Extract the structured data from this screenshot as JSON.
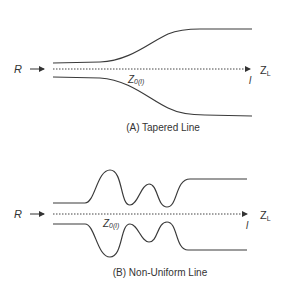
{
  "panels": [
    {
      "id": "A",
      "caption": "(A) Tapered Line",
      "source_label": "R",
      "impedance_label": "Z",
      "impedance_sub": "0(l)",
      "load_label": "Z",
      "load_sub": "L",
      "length_label": "l"
    },
    {
      "id": "B",
      "caption": "(B) Non-Uniform Line",
      "source_label": "R",
      "impedance_label": "Z",
      "impedance_sub": "0(l)",
      "load_label": "Z",
      "load_sub": "L",
      "length_label": "l"
    }
  ],
  "colors": {
    "line": "#3a3a3a",
    "text": "#333333",
    "background": "#ffffff"
  }
}
